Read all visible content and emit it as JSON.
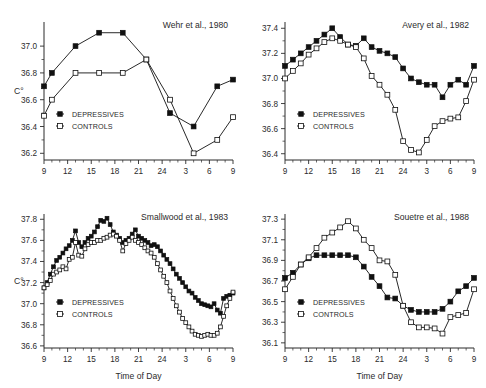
{
  "figure": {
    "background_color": "#ffffff",
    "series_color": "#111111",
    "text_color": "#2b2b2b",
    "unit_label": "C°",
    "xlabel": "Time of Day",
    "legend": {
      "depressives": "DEPRESSIVES",
      "controls": "CONTROLS"
    }
  },
  "chart_data": [
    {
      "type": "line",
      "title": "Wehr et al., 1980",
      "xlabel": "",
      "ylabel": "C°",
      "xtick_labels": [
        "9",
        "12",
        "15",
        "18",
        "21",
        "24",
        "3",
        "6",
        "9"
      ],
      "xtick_hours": [
        9,
        12,
        15,
        18,
        21,
        24,
        27,
        30,
        33
      ],
      "ytick_labels": [
        "36.2",
        "36.4",
        "36.6",
        "36.8",
        "37.0"
      ],
      "yticks": [
        36.2,
        36.4,
        36.6,
        36.8,
        37.0
      ],
      "xlim": [
        9,
        33
      ],
      "ylim": [
        36.15,
        37.18
      ],
      "grid": false,
      "legend_position": "lower-left",
      "series": [
        {
          "name": "DEPRESSIVES",
          "marker": "filled-square",
          "x": [
            9.0,
            10.0,
            13.0,
            16.0,
            19.0,
            22.0,
            25.0,
            28.0,
            31.0,
            33.0
          ],
          "values": [
            36.7,
            36.8,
            37.0,
            37.1,
            37.1,
            36.9,
            36.5,
            36.4,
            36.7,
            36.75
          ]
        },
        {
          "name": "CONTROLS",
          "marker": "open-square",
          "x": [
            9.0,
            10.0,
            13.0,
            16.0,
            19.0,
            22.0,
            25.0,
            28.0,
            31.0,
            33.0
          ],
          "values": [
            36.48,
            36.6,
            36.8,
            36.8,
            36.8,
            36.9,
            36.6,
            36.2,
            36.3,
            36.47
          ]
        }
      ]
    },
    {
      "type": "line",
      "title": "Avery et al., 1982",
      "xlabel": "",
      "ylabel": "",
      "xtick_labels": [
        "9",
        "12",
        "15",
        "18",
        "21",
        "24",
        "3",
        "6",
        "9"
      ],
      "xtick_hours": [
        9,
        12,
        15,
        18,
        21,
        24,
        27,
        30,
        33
      ],
      "ytick_labels": [
        "36.4",
        "36.6",
        "36.8",
        "37.0",
        "37.2",
        "37.4"
      ],
      "yticks": [
        36.4,
        36.6,
        36.8,
        37.0,
        37.2,
        37.4
      ],
      "xlim": [
        9,
        33
      ],
      "ylim": [
        36.35,
        37.45
      ],
      "grid": false,
      "legend_position": "lower-left",
      "series": [
        {
          "name": "DEPRESSIVES",
          "marker": "filled-square",
          "x": [
            9,
            10,
            11,
            12,
            13,
            14,
            15,
            16,
            17,
            18,
            19,
            20,
            21,
            22,
            23,
            24,
            25,
            26,
            27,
            28,
            29,
            30,
            31,
            32,
            33
          ],
          "values": [
            37.1,
            37.15,
            37.2,
            37.25,
            37.3,
            37.35,
            37.4,
            37.33,
            37.27,
            37.26,
            37.32,
            37.25,
            37.22,
            37.2,
            37.17,
            37.08,
            37.0,
            36.97,
            36.95,
            36.95,
            36.85,
            36.95,
            36.99,
            36.95,
            37.1
          ]
        },
        {
          "name": "CONTROLS",
          "marker": "open-square",
          "x": [
            9,
            10,
            11,
            12,
            13,
            14,
            15,
            16,
            17,
            18,
            19,
            20,
            21,
            22,
            23,
            24,
            25,
            26,
            27,
            28,
            29,
            30,
            31,
            32,
            33
          ],
          "values": [
            37.0,
            37.06,
            37.12,
            37.19,
            37.24,
            37.29,
            37.32,
            37.3,
            37.27,
            37.25,
            37.16,
            37.02,
            36.95,
            36.87,
            36.75,
            36.5,
            36.43,
            36.41,
            36.51,
            36.62,
            36.66,
            36.68,
            36.69,
            36.82,
            36.99
          ]
        }
      ]
    },
    {
      "type": "line",
      "title": "Smallwood et al., 1983",
      "xlabel": "Time of Day",
      "ylabel": "C°",
      "xtick_labels": [
        "9",
        "12",
        "15",
        "18",
        "21",
        "24",
        "3",
        "6",
        "9"
      ],
      "xtick_hours": [
        9,
        12,
        15,
        18,
        21,
        24,
        27,
        30,
        33
      ],
      "ytick_labels": [
        "36.6",
        "36.8",
        "37.0",
        "37.2",
        "37.4",
        "37.6",
        "37.8"
      ],
      "yticks": [
        36.6,
        36.8,
        37.0,
        37.2,
        37.4,
        37.6,
        37.8
      ],
      "xlim": [
        9,
        33
      ],
      "ylim": [
        36.58,
        37.85
      ],
      "grid": false,
      "legend_position": "lower-left",
      "series": [
        {
          "name": "DEPRESSIVES",
          "marker": "filled-square",
          "x": [
            9.0,
            9.4,
            9.8,
            10.2,
            10.6,
            11.0,
            11.4,
            11.8,
            12.2,
            12.6,
            13.0,
            13.4,
            13.8,
            14.2,
            14.6,
            15.0,
            15.4,
            15.8,
            16.2,
            16.6,
            17.0,
            17.4,
            17.8,
            18.2,
            18.6,
            19.0,
            19.4,
            19.8,
            20.2,
            20.6,
            21.0,
            21.4,
            21.8,
            22.2,
            22.6,
            23.0,
            23.4,
            23.8,
            24.2,
            24.6,
            25.0,
            25.4,
            25.8,
            26.2,
            26.6,
            27.0,
            27.4,
            27.8,
            28.2,
            28.6,
            29.0,
            29.4,
            29.8,
            30.2,
            30.6,
            31.0,
            31.4,
            31.8,
            32.2,
            32.6,
            33.0
          ],
          "values": [
            37.15,
            37.2,
            37.28,
            37.35,
            37.41,
            37.44,
            37.48,
            37.52,
            37.55,
            37.6,
            37.69,
            37.58,
            37.54,
            37.58,
            37.62,
            37.64,
            37.68,
            37.73,
            37.79,
            37.78,
            37.81,
            37.75,
            37.68,
            37.65,
            37.62,
            37.58,
            37.6,
            37.62,
            37.66,
            37.7,
            37.64,
            37.62,
            37.6,
            37.58,
            37.55,
            37.56,
            37.54,
            37.5,
            37.46,
            37.42,
            37.38,
            37.33,
            37.28,
            37.24,
            37.2,
            37.16,
            37.12,
            37.1,
            37.06,
            37.03,
            37.0,
            36.99,
            36.98,
            36.97,
            37.0,
            36.94,
            36.91,
            37.05,
            37.07,
            37.08,
            37.1
          ]
        },
        {
          "name": "CONTROLS",
          "marker": "open-square",
          "x": [
            9.0,
            9.4,
            9.8,
            10.2,
            10.6,
            11.0,
            11.4,
            11.8,
            12.2,
            12.6,
            13.0,
            13.4,
            13.8,
            14.2,
            14.6,
            15.0,
            15.4,
            15.8,
            16.2,
            16.6,
            17.0,
            17.4,
            17.8,
            18.2,
            18.6,
            19.0,
            19.4,
            19.8,
            20.2,
            20.6,
            21.0,
            21.4,
            21.8,
            22.2,
            22.6,
            23.0,
            23.4,
            23.8,
            24.2,
            24.6,
            25.0,
            25.4,
            25.8,
            26.2,
            26.6,
            27.0,
            27.4,
            27.8,
            28.2,
            28.6,
            29.0,
            29.4,
            29.8,
            30.2,
            30.6,
            31.0,
            31.4,
            31.8,
            32.2,
            32.6,
            33.0
          ],
          "values": [
            37.15,
            37.18,
            37.22,
            37.28,
            37.3,
            37.32,
            37.35,
            37.33,
            37.42,
            37.44,
            37.58,
            37.46,
            37.45,
            37.52,
            37.56,
            37.58,
            37.58,
            37.6,
            37.6,
            37.62,
            37.63,
            37.65,
            37.66,
            37.64,
            37.6,
            37.5,
            37.57,
            37.6,
            37.63,
            37.6,
            37.58,
            37.56,
            37.53,
            37.5,
            37.48,
            37.44,
            37.38,
            37.32,
            37.26,
            37.2,
            37.12,
            37.05,
            36.98,
            36.92,
            36.86,
            36.82,
            36.78,
            36.74,
            36.71,
            36.7,
            36.69,
            36.7,
            36.71,
            36.7,
            36.7,
            36.72,
            36.78,
            36.88,
            36.98,
            37.05,
            37.11
          ]
        }
      ]
    },
    {
      "type": "line",
      "title": "Souetre et al., 1988",
      "xlabel": "Time of Day",
      "ylabel": "",
      "xtick_labels": [
        "9",
        "12",
        "15",
        "18",
        "21",
        "24",
        "3",
        "6",
        "9"
      ],
      "xtick_hours": [
        9,
        12,
        15,
        18,
        21,
        24,
        27,
        30,
        33
      ],
      "ytick_labels": [
        "36.1",
        "36.3",
        "36.5",
        "36.7",
        "36.9",
        "37.1",
        "37.3"
      ],
      "yticks": [
        36.1,
        36.3,
        36.5,
        36.7,
        36.9,
        37.1,
        37.3
      ],
      "xlim": [
        9,
        33
      ],
      "ylim": [
        36.05,
        37.35
      ],
      "grid": false,
      "legend_position": "lower-left",
      "series": [
        {
          "name": "DEPRESSIVES",
          "marker": "filled-square",
          "x": [
            9,
            10,
            11,
            12,
            13,
            14,
            15,
            16,
            17,
            18,
            19,
            20,
            21,
            22,
            23,
            24,
            25,
            26,
            27,
            28,
            29,
            30,
            31,
            32,
            33
          ],
          "values": [
            36.73,
            36.78,
            36.86,
            36.92,
            36.95,
            36.95,
            36.95,
            36.95,
            36.95,
            36.93,
            36.84,
            36.74,
            36.65,
            36.54,
            36.53,
            36.46,
            36.42,
            36.4,
            36.4,
            36.4,
            36.43,
            36.5,
            36.6,
            36.65,
            36.73
          ]
        },
        {
          "name": "CONTROLS",
          "marker": "open-square",
          "x": [
            9,
            10,
            11,
            12,
            13,
            14,
            15,
            16,
            17,
            18,
            19,
            20,
            21,
            22,
            23,
            24,
            25,
            26,
            27,
            28,
            29,
            30,
            31,
            32,
            33
          ],
          "values": [
            36.62,
            36.74,
            36.86,
            36.93,
            37.02,
            37.12,
            37.17,
            37.22,
            37.28,
            37.21,
            37.1,
            37.02,
            36.9,
            36.89,
            36.76,
            36.46,
            36.3,
            36.25,
            36.25,
            36.24,
            36.19,
            36.35,
            36.37,
            36.39,
            36.62
          ]
        }
      ]
    }
  ]
}
